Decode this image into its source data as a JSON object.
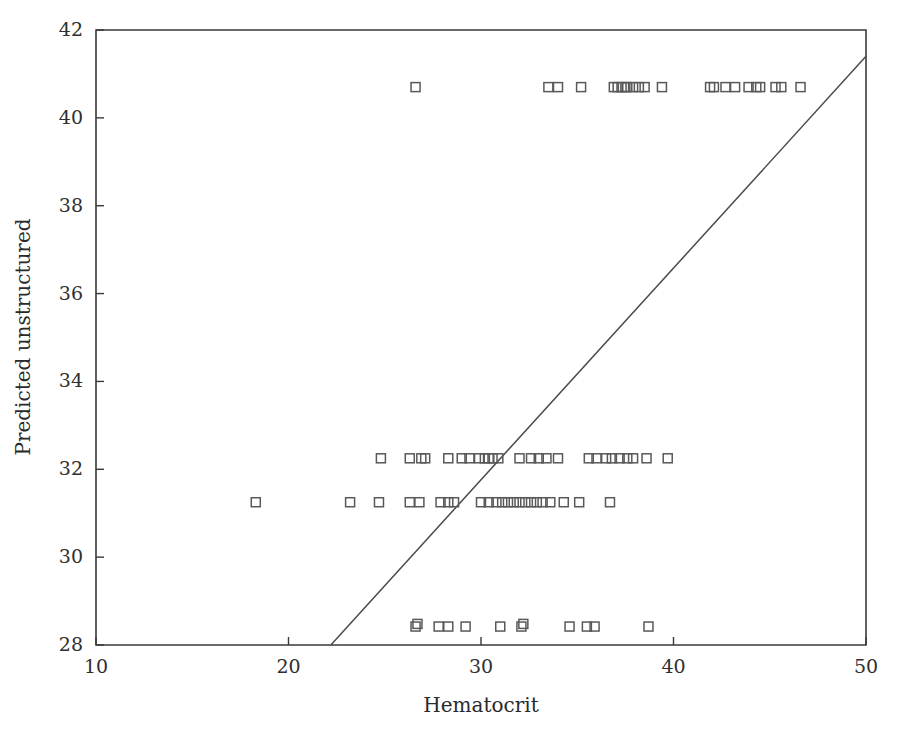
{
  "chart_data": {
    "type": "scatter",
    "title": "",
    "xlabel": "Hematocrit",
    "ylabel": "Predicted unstructured",
    "xlim": [
      10,
      50
    ],
    "ylim": [
      28,
      42
    ],
    "xticks": [
      10,
      20,
      30,
      40,
      50
    ],
    "yticks": [
      28,
      30,
      32,
      34,
      36,
      38,
      40,
      42
    ],
    "xtick_labels": [
      "10",
      "20",
      "30",
      "40",
      "50"
    ],
    "ytick_labels": [
      "28",
      "30",
      "32",
      "34",
      "36",
      "38",
      "40",
      "42"
    ],
    "grid": false,
    "legend": null,
    "marker": "open-square",
    "marker_color": "#595959",
    "marker_size": 9,
    "reference_line": {
      "label": "identity reference line",
      "x": [
        22.2,
        50.0
      ],
      "y": [
        28.0,
        41.4
      ],
      "color": "#4a4a4a"
    },
    "series": [
      {
        "name": "Predicted unstructured vs Hematocrit",
        "points": [
          [
            26.6,
            40.7
          ],
          [
            33.5,
            40.7
          ],
          [
            34.0,
            40.7
          ],
          [
            35.2,
            40.7
          ],
          [
            36.9,
            40.7
          ],
          [
            37.1,
            40.7
          ],
          [
            37.3,
            40.7
          ],
          [
            37.5,
            40.7
          ],
          [
            37.6,
            40.7
          ],
          [
            37.9,
            40.7
          ],
          [
            38.2,
            40.7
          ],
          [
            38.5,
            40.7
          ],
          [
            39.4,
            40.7
          ],
          [
            41.9,
            40.7
          ],
          [
            42.1,
            40.7
          ],
          [
            42.7,
            40.7
          ],
          [
            43.2,
            40.7
          ],
          [
            43.9,
            40.7
          ],
          [
            44.3,
            40.7
          ],
          [
            44.5,
            40.7
          ],
          [
            45.3,
            40.7
          ],
          [
            45.6,
            40.7
          ],
          [
            46.6,
            40.7
          ],
          [
            24.8,
            32.25
          ],
          [
            26.3,
            32.25
          ],
          [
            26.9,
            32.25
          ],
          [
            27.1,
            32.25
          ],
          [
            28.3,
            32.25
          ],
          [
            29.0,
            32.25
          ],
          [
            29.4,
            32.25
          ],
          [
            29.9,
            32.25
          ],
          [
            30.2,
            32.25
          ],
          [
            30.4,
            32.25
          ],
          [
            30.6,
            32.25
          ],
          [
            30.9,
            32.25
          ],
          [
            32.0,
            32.25
          ],
          [
            32.6,
            32.25
          ],
          [
            33.0,
            32.25
          ],
          [
            33.4,
            32.25
          ],
          [
            34.0,
            32.25
          ],
          [
            35.6,
            32.25
          ],
          [
            36.0,
            32.25
          ],
          [
            36.5,
            32.25
          ],
          [
            36.8,
            32.25
          ],
          [
            37.2,
            32.25
          ],
          [
            37.6,
            32.25
          ],
          [
            37.9,
            32.25
          ],
          [
            38.6,
            32.25
          ],
          [
            39.7,
            32.25
          ],
          [
            18.3,
            31.25
          ],
          [
            23.2,
            31.25
          ],
          [
            24.7,
            31.25
          ],
          [
            26.3,
            31.25
          ],
          [
            26.8,
            31.25
          ],
          [
            27.9,
            31.25
          ],
          [
            28.3,
            31.25
          ],
          [
            28.6,
            31.25
          ],
          [
            30.0,
            31.25
          ],
          [
            30.4,
            31.25
          ],
          [
            30.8,
            31.25
          ],
          [
            31.1,
            31.25
          ],
          [
            31.4,
            31.25
          ],
          [
            31.7,
            31.25
          ],
          [
            32.0,
            31.25
          ],
          [
            32.3,
            31.25
          ],
          [
            32.6,
            31.25
          ],
          [
            32.9,
            31.25
          ],
          [
            33.2,
            31.25
          ],
          [
            33.6,
            31.25
          ],
          [
            34.3,
            31.25
          ],
          [
            35.1,
            31.25
          ],
          [
            36.7,
            31.25
          ],
          [
            26.6,
            28.42
          ],
          [
            26.7,
            28.48
          ],
          [
            27.8,
            28.42
          ],
          [
            28.3,
            28.42
          ],
          [
            29.2,
            28.42
          ],
          [
            31.0,
            28.42
          ],
          [
            32.1,
            28.42
          ],
          [
            32.2,
            28.48
          ],
          [
            34.6,
            28.42
          ],
          [
            35.5,
            28.42
          ],
          [
            35.9,
            28.42
          ],
          [
            38.7,
            28.42
          ]
        ]
      }
    ]
  },
  "figure": {
    "background_color": "#ffffff",
    "axis_color": "#3a3a3a"
  }
}
